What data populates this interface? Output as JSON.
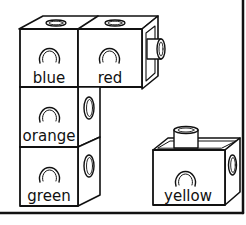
{
  "diagram": {
    "type": "connecting-cubes-worksheet",
    "colors": {
      "ink": "#111111",
      "paper": "#ffffff"
    },
    "cubes": [
      {
        "id": "blue",
        "label": "blue",
        "position": "top-left",
        "connected_to": [
          "red",
          "orange"
        ]
      },
      {
        "id": "red",
        "label": "red",
        "position": "top-right",
        "connected_to": [
          "blue"
        ],
        "has_side_peg": true
      },
      {
        "id": "orange",
        "label": "orange",
        "position": "middle-left",
        "connected_to": [
          "blue",
          "green"
        ]
      },
      {
        "id": "green",
        "label": "green",
        "position": "bottom-left",
        "connected_to": [
          "orange"
        ]
      },
      {
        "id": "yellow",
        "label": "yellow",
        "position": "bottom-right",
        "connected_to": [],
        "has_top_peg": true
      }
    ]
  }
}
